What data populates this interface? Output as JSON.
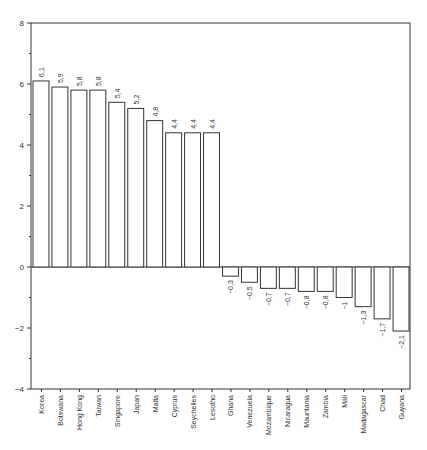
{
  "chart_data": {
    "type": "bar",
    "title": "",
    "xlabel": "",
    "ylabel": "",
    "ylim": [
      -4,
      8
    ],
    "yticks": [
      -4,
      -2,
      0,
      2,
      4,
      6,
      8
    ],
    "grid": false,
    "legend": null,
    "categories": [
      "Korea",
      "Botswana",
      "Hong Kong",
      "Taiwan",
      "Singapore",
      "Japan",
      "Malta",
      "Cyprus",
      "Seychelles",
      "Lesotho",
      "Ghana",
      "Venezuela",
      "Mozambique",
      "Nicaragua",
      "Mauritania",
      "Zambia",
      "Mali",
      "Madagascar",
      "Chad",
      "Guyana"
    ],
    "values": [
      6.1,
      5.9,
      5.8,
      5.8,
      5.4,
      5.2,
      4.8,
      4.4,
      4.4,
      4.4,
      -0.3,
      -0.5,
      -0.7,
      -0.7,
      -0.8,
      -0.8,
      -1,
      -1.3,
      -1.7,
      -2.1
    ],
    "value_labels": [
      "6,1",
      "5,9",
      "5,8",
      "5,8",
      "5,4",
      "5,2",
      "4,8",
      "4,4",
      "4,4",
      "4,4",
      "−0,3",
      "−0,5",
      "−0,7",
      "−0,7",
      "−0,8",
      "−0,8",
      "−1",
      "−1,3",
      "−1,7",
      "−2,1"
    ],
    "ytick_labels": [
      "−4",
      "−2",
      "0",
      "2",
      "4",
      "6",
      "8"
    ]
  },
  "style": {
    "bar_fill": "#ffffff",
    "bar_stroke": "#333333",
    "axis_color": "#333333"
  }
}
